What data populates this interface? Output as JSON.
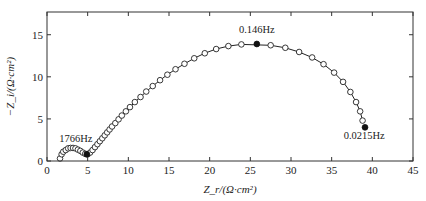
{
  "chart_data": {
    "type": "scatter",
    "title": "",
    "xlabel": "Z_r/(Ω·cm²)",
    "ylabel": "−Z_i/(Ω·cm²)",
    "xlim": [
      0,
      45
    ],
    "ylim": [
      0,
      17.7
    ],
    "xticks": [
      0,
      5,
      10,
      15,
      20,
      25,
      30,
      35,
      40,
      45
    ],
    "yticks": [
      0,
      5,
      10,
      15
    ],
    "grid": false,
    "legend": null,
    "series": [
      {
        "name": "measured",
        "marker": "open-circle",
        "x": [
          1.6,
          1.8,
          2.0,
          2.3,
          2.6,
          2.9,
          3.2,
          3.5,
          3.8,
          4.1,
          4.4,
          4.7,
          5.0,
          5.3,
          5.6,
          5.9,
          6.2,
          6.5,
          6.8,
          7.1,
          7.4,
          7.7,
          8.0,
          8.4,
          8.8,
          9.2,
          9.7,
          10.2,
          10.8,
          11.5,
          12.2,
          13.0,
          13.9,
          14.8,
          15.8,
          16.9,
          18.1,
          19.4,
          20.8,
          22.3,
          23.9,
          27.5,
          29.3,
          31.0,
          32.6,
          34.0,
          35.3,
          36.4,
          37.3,
          38.0,
          38.5,
          38.8
        ],
        "y": [
          0.3,
          0.8,
          1.1,
          1.3,
          1.5,
          1.55,
          1.55,
          1.5,
          1.35,
          1.2,
          1.0,
          0.85,
          0.8,
          1.0,
          1.3,
          1.65,
          2.0,
          2.35,
          2.7,
          3.05,
          3.4,
          3.75,
          4.1,
          4.5,
          4.95,
          5.4,
          5.9,
          6.4,
          7.0,
          7.6,
          8.25,
          8.9,
          9.6,
          10.25,
          10.9,
          11.55,
          12.2,
          12.8,
          13.3,
          13.65,
          13.85,
          13.75,
          13.45,
          12.95,
          12.3,
          11.5,
          10.5,
          9.4,
          8.2,
          7.0,
          5.9,
          4.8
        ]
      },
      {
        "name": "marked frequencies",
        "marker": "filled-circle",
        "x": [
          25.8,
          39.1,
          4.9
        ],
        "y": [
          13.9,
          4.0,
          0.8
        ]
      }
    ],
    "fit_curve": true,
    "annotations": [
      {
        "text": "1766Hz",
        "x": 1.5,
        "y": 2.3
      },
      {
        "text": "0.146Hz",
        "x": 25.8,
        "y": 15.2
      },
      {
        "text": "0.0215Hz",
        "x": 39.0,
        "y": 2.6
      }
    ]
  }
}
